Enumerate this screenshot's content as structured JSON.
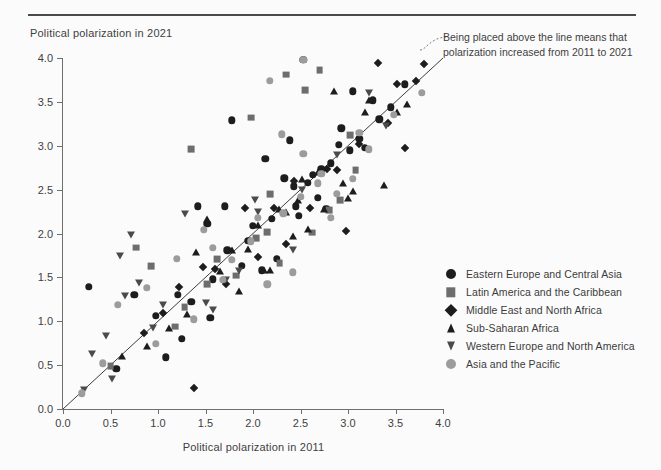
{
  "figure": {
    "y_axis_title": "Political polarization in 2021",
    "x_axis_title": "Political polarization in 2011",
    "annotation": "Being placed above the line means that polarization increased from 2011 to 2021"
  },
  "colors": {
    "dark": "#1d1d1d",
    "gray_square": "#6d6d6d",
    "gray_circle": "#9c9c9c",
    "tri_down": "#4a4a4a",
    "axis": "#6f6f6f",
    "text": "#3f3f3f",
    "background": "#fbfbfb",
    "rule": "#4a4a4a"
  },
  "chart_data": {
    "type": "scatter",
    "title": "",
    "xlabel": "Political polarization in 2011",
    "ylabel": "Political polarization in 2021",
    "xlim": [
      0.0,
      4.0
    ],
    "ylim": [
      0.0,
      4.0
    ],
    "xticks": [
      "0.0",
      "0.5",
      "1.0",
      "1.5",
      "2.0",
      "2.5",
      "3.0",
      "3.5",
      "4.0"
    ],
    "yticks": [
      "0.0",
      "0.5",
      "1.0",
      "1.5",
      "2.0",
      "2.5",
      "3.0",
      "3.5",
      "4.0"
    ],
    "grid": false,
    "legend_position": "right",
    "reference_line": {
      "label": "y = x",
      "from": [
        0.0,
        0.0
      ],
      "to": [
        4.05,
        4.05
      ]
    },
    "annotations": [
      {
        "text": "Being placed above the line means that polarization increased from 2011 to 2021",
        "target": [
          3.82,
          3.93
        ]
      }
    ],
    "series": [
      {
        "name": "Eastern Europe and Central Asia",
        "marker": "circle",
        "color": "#1d1d1d",
        "points": [
          [
            1.78,
            3.29
          ],
          [
            2.53,
            3.98
          ],
          [
            2.13,
            2.85
          ],
          [
            2.39,
            3.06
          ],
          [
            1.42,
            2.31
          ],
          [
            1.7,
            2.31
          ],
          [
            2.43,
            2.54
          ],
          [
            1.52,
            2.11
          ],
          [
            2.93,
            3.2
          ],
          [
            2.9,
            3.01
          ],
          [
            3.02,
            2.95
          ],
          [
            2.33,
            2.63
          ],
          [
            0.27,
            1.39
          ],
          [
            0.75,
            1.3
          ],
          [
            1.21,
            1.3
          ],
          [
            1.55,
            1.04
          ],
          [
            2.2,
            2.17
          ],
          [
            2.25,
            1.71
          ],
          [
            1.25,
            0.8
          ],
          [
            1.08,
            0.59
          ],
          [
            2.63,
            2.67
          ],
          [
            2.72,
            2.73
          ],
          [
            2.45,
            2.31
          ],
          [
            2.58,
            2.58
          ],
          [
            3.26,
            3.52
          ],
          [
            3.12,
            3.08
          ],
          [
            2.82,
            2.8
          ],
          [
            3.05,
            3.62
          ],
          [
            1.95,
            1.92
          ],
          [
            1.73,
            1.81
          ],
          [
            1.58,
            1.48
          ],
          [
            1.35,
            1.22
          ],
          [
            2.0,
            2.09
          ],
          [
            2.68,
            2.41
          ],
          [
            3.45,
            3.44
          ],
          [
            3.6,
            3.7
          ],
          [
            2.09,
            1.58
          ],
          [
            1.88,
            1.63
          ],
          [
            0.98,
            1.06
          ],
          [
            0.56,
            0.46
          ],
          [
            3.33,
            3.3
          ],
          [
            2.48,
            2.2
          ],
          [
            2.77,
            2.28
          ],
          [
            3.18,
            2.98
          ]
        ]
      },
      {
        "name": "Latin America and the Caribbean",
        "marker": "square",
        "color": "#6d6d6d",
        "points": [
          [
            1.35,
            2.96
          ],
          [
            1.98,
            3.32
          ],
          [
            2.35,
            3.81
          ],
          [
            2.7,
            3.86
          ],
          [
            2.55,
            3.63
          ],
          [
            3.02,
            3.12
          ],
          [
            2.03,
            1.95
          ],
          [
            1.82,
            1.52
          ],
          [
            0.77,
            1.84
          ],
          [
            0.5,
            0.49
          ],
          [
            1.28,
            1.16
          ],
          [
            2.28,
            1.66
          ],
          [
            2.8,
            2.27
          ],
          [
            3.08,
            2.72
          ],
          [
            2.15,
            2.02
          ],
          [
            1.62,
            1.71
          ],
          [
            2.62,
            2.01
          ],
          [
            1.18,
            0.94
          ],
          [
            2.92,
            2.38
          ],
          [
            1.52,
            1.42
          ],
          [
            2.18,
            2.45
          ],
          [
            0.93,
            1.63
          ]
        ]
      },
      {
        "name": "Middle East and North Africa",
        "marker": "diamond",
        "color": "#1d1d1d",
        "points": [
          [
            3.32,
            3.94
          ],
          [
            3.52,
            3.7
          ],
          [
            3.72,
            3.74
          ],
          [
            2.22,
            2.29
          ],
          [
            2.6,
            2.29
          ],
          [
            1.92,
            2.29
          ],
          [
            1.47,
            1.62
          ],
          [
            1.6,
            1.6
          ],
          [
            1.22,
            1.39
          ],
          [
            1.05,
            1.09
          ],
          [
            2.98,
            2.03
          ],
          [
            3.8,
            3.93
          ],
          [
            2.43,
            2.6
          ],
          [
            2.78,
            2.74
          ],
          [
            3.12,
            3.02
          ],
          [
            3.42,
            3.26
          ],
          [
            1.38,
            0.24
          ],
          [
            2.05,
            1.73
          ],
          [
            0.85,
            0.87
          ],
          [
            3.6,
            2.97
          ],
          [
            2.88,
            2.72
          ],
          [
            2.35,
            1.88
          ],
          [
            1.72,
            1.42
          ]
        ]
      },
      {
        "name": "Sub-Saharan Africa",
        "marker": "triangle-up",
        "color": "#1d1d1d",
        "points": [
          [
            3.18,
            3.39
          ],
          [
            3.22,
            3.52
          ],
          [
            2.85,
            3.62
          ],
          [
            3.52,
            3.38
          ],
          [
            2.47,
            2.38
          ],
          [
            2.35,
            2.24
          ],
          [
            2.05,
            2.1
          ],
          [
            1.52,
            2.17
          ],
          [
            1.4,
            1.79
          ],
          [
            1.78,
            1.81
          ],
          [
            2.52,
            2.62
          ],
          [
            2.68,
            2.7
          ],
          [
            2.95,
            2.57
          ],
          [
            3.05,
            2.49
          ],
          [
            2.27,
            2.28
          ],
          [
            1.95,
            1.82
          ],
          [
            1.65,
            1.57
          ],
          [
            1.12,
            0.92
          ],
          [
            0.88,
            0.72
          ],
          [
            2.12,
            1.58
          ],
          [
            2.18,
            1.58
          ],
          [
            3.38,
            2.55
          ],
          [
            2.75,
            2.28
          ],
          [
            3.62,
            3.48
          ],
          [
            2.42,
            1.97
          ],
          [
            1.85,
            1.35
          ],
          [
            1.3,
            1.08
          ],
          [
            0.62,
            0.6
          ],
          [
            2.58,
            2.05
          ],
          [
            3.0,
            2.41
          ]
        ]
      },
      {
        "name": "Western Europe and North America",
        "marker": "triangle-down",
        "color": "#4a4a4a",
        "points": [
          [
            3.22,
            3.6
          ],
          [
            3.4,
            3.23
          ],
          [
            2.02,
            2.38
          ],
          [
            2.05,
            2.24
          ],
          [
            1.28,
            2.22
          ],
          [
            0.72,
            1.98
          ],
          [
            0.6,
            1.74
          ],
          [
            2.52,
            2.5
          ],
          [
            0.8,
            1.44
          ],
          [
            0.65,
            1.29
          ],
          [
            1.05,
            1.19
          ],
          [
            0.95,
            0.92
          ],
          [
            0.45,
            0.83
          ],
          [
            0.3,
            0.63
          ],
          [
            0.22,
            0.22
          ],
          [
            1.5,
            1.21
          ],
          [
            1.72,
            1.47
          ],
          [
            2.88,
            2.89
          ],
          [
            2.42,
            1.81
          ],
          [
            0.52,
            0.34
          ],
          [
            1.58,
            1.13
          ],
          [
            1.85,
            1.57
          ]
        ]
      },
      {
        "name": "Asia and the Pacific",
        "marker": "circle-gray",
        "color": "#9c9c9c",
        "points": [
          [
            2.18,
            3.74
          ],
          [
            2.53,
            3.98
          ],
          [
            2.3,
            3.13
          ],
          [
            2.53,
            2.91
          ],
          [
            2.72,
            2.68
          ],
          [
            2.5,
            2.42
          ],
          [
            1.48,
            2.04
          ],
          [
            1.2,
            1.71
          ],
          [
            0.88,
            1.38
          ],
          [
            0.58,
            1.19
          ],
          [
            0.2,
            0.18
          ],
          [
            1.98,
            1.91
          ],
          [
            2.05,
            2.18
          ],
          [
            2.32,
            2.23
          ],
          [
            2.68,
            2.57
          ],
          [
            3.05,
            2.62
          ],
          [
            3.22,
            2.96
          ],
          [
            3.48,
            3.35
          ],
          [
            3.78,
            3.6
          ],
          [
            1.68,
            1.47
          ],
          [
            1.38,
            1.02
          ],
          [
            2.42,
            1.56
          ],
          [
            2.82,
            2.18
          ],
          [
            0.98,
            0.74
          ],
          [
            1.78,
            1.7
          ],
          [
            2.15,
            1.42
          ],
          [
            3.12,
            3.15
          ],
          [
            2.88,
            2.45
          ],
          [
            1.58,
            1.84
          ],
          [
            0.42,
            0.52
          ]
        ]
      }
    ]
  },
  "legend": {
    "items": [
      {
        "label": "Eastern Europe and Central Asia",
        "marker": "circle",
        "color": "#1d1d1d"
      },
      {
        "label": "Latin America and the Caribbean",
        "marker": "square",
        "color": "#6d6d6d"
      },
      {
        "label": "Middle East and North Africa",
        "marker": "diamond",
        "color": "#1d1d1d"
      },
      {
        "label": "Sub-Saharan Africa",
        "marker": "triangle-up",
        "color": "#1d1d1d"
      },
      {
        "label": "Western Europe and North America",
        "marker": "triangle-down",
        "color": "#4a4a4a"
      },
      {
        "label": "Asia and the Pacific",
        "marker": "circle-gray",
        "color": "#9c9c9c"
      }
    ]
  }
}
